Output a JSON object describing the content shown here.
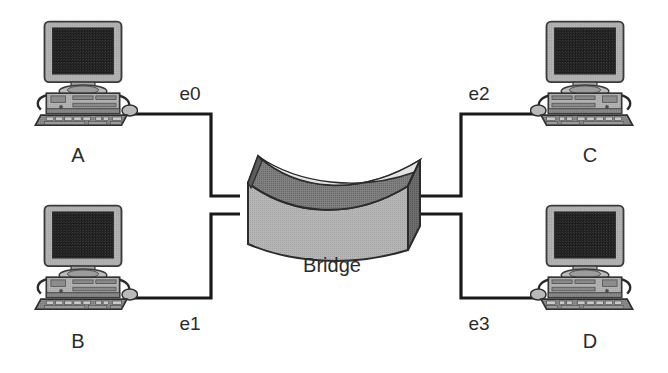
{
  "diagram": {
    "background_color": "#ffffff",
    "line_color": "#1a1a1a",
    "text_color": "#2b2b2b",
    "bridge": {
      "label": "Bridge",
      "icon_name": "bridge-3d-block",
      "front_face_color": "#b0b0b0",
      "top_face_color": "#7a7a7a",
      "side_face_color": "#696969",
      "curve_highlight_color": "#e8e8e8",
      "outline_color": "#2b2b2b"
    },
    "hosts": [
      {
        "id": "A",
        "label": "A",
        "icon_name": "desktop-computer-icon",
        "side": "left",
        "row": "top",
        "port": "e0"
      },
      {
        "id": "B",
        "label": "B",
        "icon_name": "desktop-computer-icon",
        "side": "left",
        "row": "bottom",
        "port": "e1"
      },
      {
        "id": "C",
        "label": "C",
        "icon_name": "desktop-computer-icon",
        "side": "right",
        "row": "top",
        "port": "e2"
      },
      {
        "id": "D",
        "label": "D",
        "icon_name": "desktop-computer-icon",
        "side": "right",
        "row": "bottom",
        "port": "e3"
      }
    ],
    "ports": [
      {
        "id": "e0",
        "label": "e0",
        "connects_host": "A"
      },
      {
        "id": "e1",
        "label": "e1",
        "connects_host": "B"
      },
      {
        "id": "e2",
        "label": "e2",
        "connects_host": "C"
      },
      {
        "id": "e3",
        "label": "e3",
        "connects_host": "D"
      }
    ],
    "links": [
      {
        "id": "link-a-e0",
        "from": "A",
        "to": "e0"
      },
      {
        "id": "link-b-e1",
        "from": "B",
        "to": "e1"
      },
      {
        "id": "link-c-e2",
        "from": "C",
        "to": "e2"
      },
      {
        "id": "link-d-e3",
        "from": "D",
        "to": "e3"
      }
    ],
    "monitor_screen_color": "#1c1c1c",
    "case_color": "#aeaeae"
  }
}
